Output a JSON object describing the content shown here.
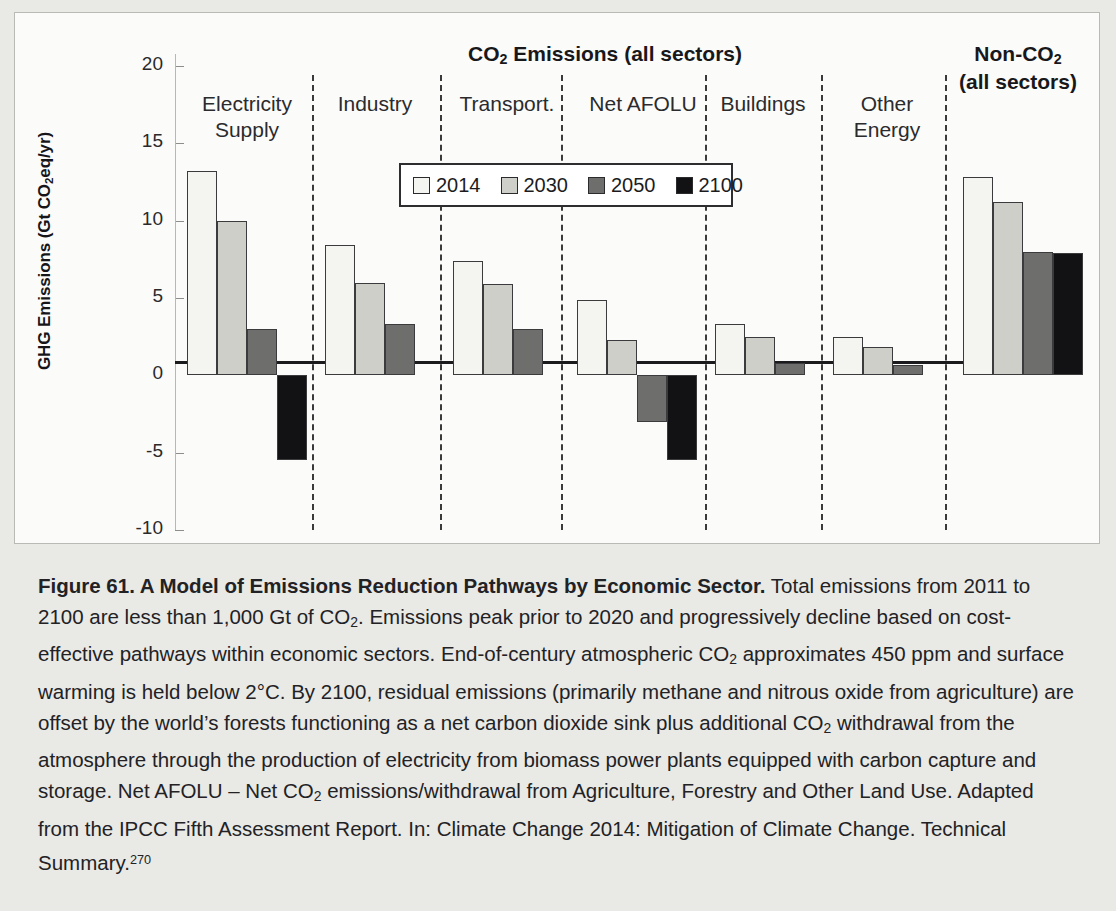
{
  "figure": {
    "panel_title_line1": "CO",
    "panel_title_sub": "2",
    "panel_title_line1b": " Emissions (all sectors)",
    "noncoo_title_line1": "Non-CO",
    "noncoo_title_sub": "2",
    "noncoo_title_line2": "(all sectors)",
    "y_axis_title_a": "GHG Emissions (Gt CO",
    "y_axis_title_sub": "2",
    "y_axis_title_b": "eq/yr)"
  },
  "caption": {
    "bold": "Figure 61. A Model of Emissions Reduction Pathways by Economic Sector.",
    "rest_1": " Total emissions from 2011 to 2100 are less than 1,000 Gt of CO",
    "rest_2": ". Emissions peak prior to 2020 and progressively decline based on cost-effective pathways within economic sectors. End-of-century atmospheric CO",
    "rest_3": " approximates 450 ppm and surface warming is held below 2°C. By 2100, residual emissions (primarily methane and nitrous oxide from agriculture) are offset by the world’s forests functioning as a net carbon dioxide sink plus additional CO",
    "rest_4": " withdrawal from the atmosphere through the production of electricity from biomass power plants equipped with carbon capture and storage. Net AFOLU – Net CO",
    "rest_5": " emissions/withdrawal from Agriculture, Forestry and Other Land Use. Adapted from the IPCC Fifth Assessment Report. In: Climate Change 2014: Mitigation of Climate Change. Technical Summary.",
    "footnote_marker": "270",
    "sub": "2"
  },
  "chart_data": {
    "type": "bar",
    "title": "CO2 Emissions (all sectors)",
    "secondary_title": "Non-CO2 (all sectors)",
    "xlabel": "",
    "ylabel": "GHG Emissions (Gt CO2eq/yr)",
    "ylim": [
      -10,
      20
    ],
    "yticks": [
      20,
      15,
      10,
      5,
      0,
      -5,
      -10
    ],
    "ytick_labels": [
      "20",
      "15",
      "10",
      "5",
      "0",
      "-5",
      "-10"
    ],
    "grid": false,
    "legend_position": "top-center",
    "legend_entries": [
      "2014",
      "2030",
      "2050",
      "2100"
    ],
    "series_colors": [
      "#f4f4f0",
      "#cfcfca",
      "#6e6e6c",
      "#121214"
    ],
    "categories": [
      "Electricity Supply",
      "Industry",
      "Transport.",
      "Net AFOLU",
      "Buildings",
      "Other Energy",
      "Non-CO2 (all sectors)"
    ],
    "series": [
      {
        "name": "2014",
        "values": [
          13.2,
          8.4,
          7.4,
          4.9,
          3.35,
          2.5,
          12.85
        ]
      },
      {
        "name": "2030",
        "values": [
          10.0,
          6.0,
          5.9,
          2.3,
          2.5,
          1.85,
          11.2
        ]
      },
      {
        "name": "2050",
        "values": [
          3.0,
          3.35,
          3.0,
          -3.0,
          0.8,
          0.65,
          7.95
        ]
      },
      {
        "name": "2100",
        "values": [
          -5.5,
          null,
          null,
          -5.5,
          null,
          null,
          7.9
        ]
      }
    ],
    "group_label_lines": [
      [
        "Electricity",
        "Supply"
      ],
      [
        "Industry"
      ],
      [
        "Transport."
      ],
      [
        "Net AFOLU"
      ],
      [
        "Buildings"
      ],
      [
        "Other",
        "Energy"
      ],
      [
        "Non-CO2",
        "(all sectors)"
      ]
    ]
  }
}
